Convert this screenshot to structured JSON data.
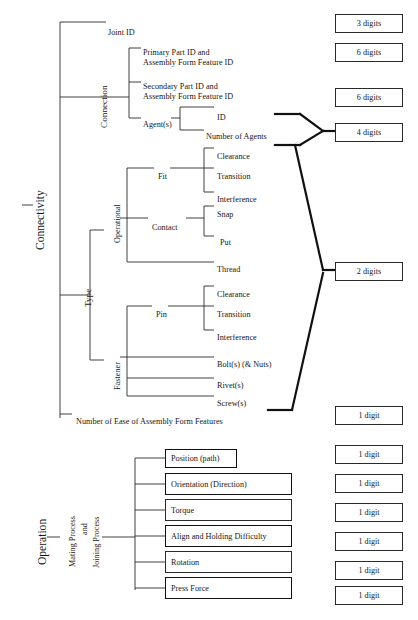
{
  "diagram": {
    "line_color": "#2a2a2a",
    "thick_line_color": "#111111",
    "text_color": "#161616"
  },
  "roots": {
    "connectivity": "Connectivity",
    "operation": "Operation"
  },
  "connectivity": {
    "joint_id": "Joint ID",
    "connection": {
      "label": "Connection",
      "children": [
        {
          "label": "Primary Part ID and\nAssembly Form Feature ID"
        },
        {
          "label": "Secondary Part ID and\nAssembly Form Feature ID"
        },
        {
          "label": "Agent(s)",
          "children": [
            {
              "label": "ID"
            },
            {
              "label": "Number of Agents"
            }
          ]
        }
      ]
    },
    "type": {
      "label": "Type",
      "operational": {
        "label": "Operational",
        "children": [
          {
            "label": "Fit",
            "children": [
              {
                "label": "Clearance"
              },
              {
                "label": "Transition"
              },
              {
                "label": "Interference"
              }
            ]
          },
          {
            "label": "Contact",
            "children": [
              {
                "label": "Snap"
              },
              {
                "label": "Put"
              }
            ]
          },
          {
            "label": "Thread"
          }
        ]
      },
      "fastener": {
        "label": "Fastener",
        "children": [
          {
            "label": "Pin",
            "children": [
              {
                "label": "Clearance"
              },
              {
                "label": "Transition"
              },
              {
                "label": "Interference"
              }
            ]
          },
          {
            "label": "Bolt(s) (& Nuts)"
          },
          {
            "label": "Rivet(s)"
          },
          {
            "label": "Screw(s)"
          }
        ]
      }
    },
    "ease_of_assembly": "Number of Ease of Assembly Form Features"
  },
  "operation": {
    "process": "Mating Process\nand\nJoining Process",
    "process_line1": "Mating Process",
    "process_line2": "and",
    "process_line3": "Joining Process",
    "items": [
      {
        "label": "Position (path)"
      },
      {
        "label": "Orientation (Direction)"
      },
      {
        "label": "Torque"
      },
      {
        "label": "Align and Holding Difficulty"
      },
      {
        "label": "Rotation"
      },
      {
        "label": "Press Force"
      }
    ]
  },
  "digit_boxes": [
    {
      "label": "3 digits",
      "x": 335,
      "y": 14,
      "w": 68,
      "h": 19
    },
    {
      "label": "6 digits",
      "x": 335,
      "y": 43,
      "w": 68,
      "h": 19
    },
    {
      "label": "6 digits",
      "x": 335,
      "y": 88,
      "w": 68,
      "h": 19
    },
    {
      "label": "4 digits",
      "x": 335,
      "y": 123,
      "w": 68,
      "h": 19
    },
    {
      "label": "2 digits",
      "x": 335,
      "y": 262,
      "w": 68,
      "h": 19
    },
    {
      "label": "1 digit",
      "x": 335,
      "y": 406,
      "w": 68,
      "h": 19
    },
    {
      "label": "1 digit",
      "x": 335,
      "y": 445,
      "w": 68,
      "h": 19
    },
    {
      "label": "1 digit",
      "x": 335,
      "y": 474,
      "w": 68,
      "h": 19
    },
    {
      "label": "1 digit",
      "x": 335,
      "y": 503,
      "w": 68,
      "h": 19
    },
    {
      "label": "1 digit",
      "x": 335,
      "y": 532,
      "w": 68,
      "h": 19
    },
    {
      "label": "1 digit",
      "x": 335,
      "y": 561,
      "w": 68,
      "h": 19
    },
    {
      "label": "1 digit",
      "x": 335,
      "y": 586,
      "w": 68,
      "h": 19
    }
  ],
  "operation_boxes": [
    {
      "label": "Position (path)",
      "x": 165,
      "y": 449,
      "w": 72,
      "h": 19,
      "thick": true
    },
    {
      "label": "Orientation (Direction)",
      "x": 165,
      "y": 473,
      "w": 127,
      "h": 22,
      "thick": true
    },
    {
      "label": "Torque",
      "x": 165,
      "y": 499,
      "w": 127,
      "h": 22,
      "thick": false
    },
    {
      "label": "Align and Holding Difficulty",
      "x": 165,
      "y": 525,
      "w": 127,
      "h": 22,
      "thick": true
    },
    {
      "label": "Rotation",
      "x": 165,
      "y": 551,
      "w": 127,
      "h": 22,
      "thick": false
    },
    {
      "label": "Press Force",
      "x": 165,
      "y": 577,
      "w": 127,
      "h": 22,
      "thick": true
    }
  ],
  "labels": [
    {
      "name": "root-connectivity",
      "text": "Connectivity",
      "x": 33,
      "y": 250,
      "rot": -90,
      "size": "big"
    },
    {
      "name": "node-joint-id",
      "text": "Joint ID",
      "x": 108,
      "y": 28,
      "rot": 0,
      "size": ""
    },
    {
      "name": "node-connection",
      "text": "Connection",
      "x": 99,
      "y": 128,
      "rot": -90,
      "size": "mid"
    },
    {
      "name": "node-primary-part",
      "text": "Primary Part ID and",
      "x": 143,
      "y": 48,
      "rot": 0,
      "size": ""
    },
    {
      "name": "node-primary-part-2",
      "text": "Assembly Form Feature ID",
      "x": 143,
      "y": 58,
      "rot": 0,
      "size": ""
    },
    {
      "name": "node-secondary-part",
      "text": "Secondary Part ID and",
      "x": 143,
      "y": 82,
      "rot": 0,
      "size": ""
    },
    {
      "name": "node-secondary-part-2",
      "text": "Assembly Form Feature ID",
      "x": 143,
      "y": 92,
      "rot": 0,
      "size": ""
    },
    {
      "name": "node-agents",
      "text": "Agent(s)",
      "x": 143,
      "y": 120,
      "rot": 0,
      "size": ""
    },
    {
      "name": "node-agent-id",
      "text": "ID",
      "x": 217,
      "y": 113,
      "rot": 0,
      "size": ""
    },
    {
      "name": "node-number-of-agents",
      "text": "Number of Agents",
      "x": 206,
      "y": 132,
      "rot": 0,
      "size": ""
    },
    {
      "name": "node-type",
      "text": "Type",
      "x": 83,
      "y": 307,
      "rot": -90,
      "size": "mid"
    },
    {
      "name": "node-operational",
      "text": "Operational",
      "x": 113,
      "y": 243,
      "rot": -90,
      "size": ""
    },
    {
      "name": "node-fit",
      "text": "Fit",
      "x": 158,
      "y": 172,
      "rot": 0,
      "size": ""
    },
    {
      "name": "node-fit-clearance",
      "text": "Clearance",
      "x": 217,
      "y": 152,
      "rot": 0,
      "size": ""
    },
    {
      "name": "node-fit-transition",
      "text": "Transition",
      "x": 217,
      "y": 172,
      "rot": 0,
      "size": ""
    },
    {
      "name": "node-fit-interference",
      "text": "Interference",
      "x": 217,
      "y": 195,
      "rot": 0,
      "size": ""
    },
    {
      "name": "node-contact",
      "text": "Contact",
      "x": 152,
      "y": 223,
      "rot": 0,
      "size": ""
    },
    {
      "name": "node-contact-snap",
      "text": "Snap",
      "x": 217,
      "y": 210,
      "rot": 0,
      "size": ""
    },
    {
      "name": "node-contact-put",
      "text": "Put",
      "x": 220,
      "y": 238,
      "rot": 0,
      "size": ""
    },
    {
      "name": "node-thread",
      "text": "Thread",
      "x": 217,
      "y": 265,
      "rot": 0,
      "size": ""
    },
    {
      "name": "node-fastener",
      "text": "Fastener",
      "x": 113,
      "y": 390,
      "rot": -90,
      "size": ""
    },
    {
      "name": "node-pin",
      "text": "Pin",
      "x": 156,
      "y": 310,
      "rot": 0,
      "size": ""
    },
    {
      "name": "node-pin-clearance",
      "text": "Clearance",
      "x": 217,
      "y": 290,
      "rot": 0,
      "size": ""
    },
    {
      "name": "node-pin-transition",
      "text": "Transition",
      "x": 217,
      "y": 310,
      "rot": 0,
      "size": ""
    },
    {
      "name": "node-pin-interference",
      "text": "Interference",
      "x": 217,
      "y": 333,
      "rot": 0,
      "size": ""
    },
    {
      "name": "node-bolts",
      "text": "Bolt(s) (& Nuts)",
      "x": 217,
      "y": 360,
      "rot": 0,
      "size": ""
    },
    {
      "name": "node-rivets",
      "text": "Rivet(s)",
      "x": 217,
      "y": 381,
      "rot": 0,
      "size": ""
    },
    {
      "name": "node-screws",
      "text": "Screw(s)",
      "x": 217,
      "y": 399,
      "rot": 0,
      "size": ""
    },
    {
      "name": "node-ease-of-assembly",
      "text": "Number of Ease of Assembly Form Features",
      "x": 76,
      "y": 417,
      "rot": 0,
      "size": ""
    },
    {
      "name": "root-operation",
      "text": "Operation",
      "x": 35,
      "y": 565,
      "rot": -90,
      "size": "big"
    },
    {
      "name": "node-mating-process",
      "text": "Mating Process",
      "x": 68,
      "y": 567,
      "rot": -90,
      "size": ""
    },
    {
      "name": "node-mating-and",
      "text": "and",
      "x": 80,
      "y": 535,
      "rot": -90,
      "size": ""
    },
    {
      "name": "node-joining-process",
      "text": "Joining Process",
      "x": 92,
      "y": 568,
      "rot": -90,
      "size": ""
    }
  ],
  "lines": {
    "thin": [
      [
        60,
        22,
        60,
        418
      ],
      [
        60,
        22,
        106,
        22
      ],
      [
        60,
        97,
        129,
        97
      ],
      [
        129,
        48,
        129,
        118
      ],
      [
        129,
        48,
        141,
        48
      ],
      [
        129,
        82,
        141,
        82
      ],
      [
        129,
        118,
        141,
        118
      ],
      [
        180,
        107,
        180,
        130
      ],
      [
        180,
        107,
        214,
        107
      ],
      [
        180,
        130,
        204,
        130
      ],
      [
        171,
        118,
        180,
        118
      ],
      [
        90,
        230,
        90,
        360
      ],
      [
        60,
        295,
        90,
        295
      ],
      [
        90,
        230,
        104,
        230
      ],
      [
        90,
        360,
        104,
        360
      ],
      [
        127,
        168,
        127,
        262
      ],
      [
        120,
        218,
        127,
        218
      ],
      [
        127,
        168,
        154,
        168
      ],
      [
        127,
        218,
        148,
        218
      ],
      [
        127,
        262,
        214,
        262
      ],
      [
        170,
        168,
        204,
        168
      ],
      [
        204,
        148,
        204,
        192
      ],
      [
        204,
        148,
        214,
        148
      ],
      [
        204,
        168,
        214,
        168
      ],
      [
        204,
        192,
        214,
        192
      ],
      [
        186,
        218,
        204,
        218
      ],
      [
        204,
        206,
        204,
        236
      ],
      [
        204,
        206,
        214,
        206
      ],
      [
        204,
        236,
        214,
        236
      ],
      [
        127,
        306,
        127,
        396
      ],
      [
        120,
        357,
        127,
        357
      ],
      [
        127,
        306,
        152,
        306
      ],
      [
        127,
        357,
        214,
        357
      ],
      [
        127,
        378,
        214,
        378
      ],
      [
        127,
        396,
        214,
        396
      ],
      [
        168,
        306,
        204,
        306
      ],
      [
        204,
        286,
        204,
        330
      ],
      [
        204,
        286,
        214,
        286
      ],
      [
        204,
        306,
        214,
        306
      ],
      [
        204,
        330,
        214,
        330
      ],
      [
        60,
        414,
        72,
        414
      ],
      [
        47,
        537,
        60,
        537
      ],
      [
        102,
        537,
        135,
        537
      ],
      [
        135,
        458,
        135,
        590
      ],
      [
        135,
        458,
        165,
        458
      ],
      [
        135,
        484,
        165,
        484
      ],
      [
        135,
        510,
        165,
        510
      ],
      [
        135,
        536,
        165,
        536
      ],
      [
        135,
        562,
        165,
        562
      ],
      [
        135,
        588,
        165,
        588
      ],
      [
        22,
        205,
        33,
        205
      ]
    ],
    "thick": [
      [
        275,
        114,
        300,
        114
      ],
      [
        300,
        114,
        323,
        131
      ],
      [
        323,
        131,
        335,
        131
      ],
      [
        300,
        145,
        323,
        131
      ],
      [
        275,
        145,
        300,
        145
      ],
      [
        295,
        145,
        323,
        270
      ],
      [
        323,
        270,
        335,
        270
      ],
      [
        323,
        273,
        292,
        410
      ],
      [
        292,
        410,
        268,
        410
      ]
    ]
  }
}
